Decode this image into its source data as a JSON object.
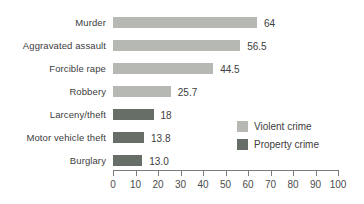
{
  "chart_data": {
    "type": "bar",
    "orientation": "horizontal",
    "title": "",
    "xlabel": "",
    "ylabel": "",
    "categories": [
      "Murder",
      "Aggravated assault",
      "Forcible rape",
      "Robbery",
      "Larceny/theft",
      "Motor vehicle theft",
      "Burglary"
    ],
    "values": [
      64,
      56.5,
      44.5,
      25.7,
      18,
      13.8,
      13.0
    ],
    "value_labels": [
      "64",
      "56.5",
      "44.5",
      "25.7",
      "18",
      "13.8",
      "13.0"
    ],
    "series_of_category": [
      "violent",
      "violent",
      "violent",
      "violent",
      "property",
      "property",
      "property"
    ],
    "xlim": [
      0,
      100
    ],
    "x_ticks": [
      0,
      10,
      20,
      30,
      40,
      50,
      60,
      70,
      80,
      90,
      100
    ],
    "grid": false,
    "legend": {
      "position": "inside-right",
      "entries": [
        {
          "key": "violent",
          "label": "Violent crime",
          "color": "#b6b9b3"
        },
        {
          "key": "property",
          "label": "Property crime",
          "color": "#676d67"
        }
      ]
    }
  },
  "colors": {
    "background": "#ffffff",
    "axis": "#7c7c7c",
    "tick_text": "#4c4c4c",
    "label_text": "#3d3d3d",
    "violent_bar": "#b6b9b3",
    "property_bar": "#676d67",
    "artifact_dark": "#141414",
    "artifact_light": "#9aa09a"
  }
}
